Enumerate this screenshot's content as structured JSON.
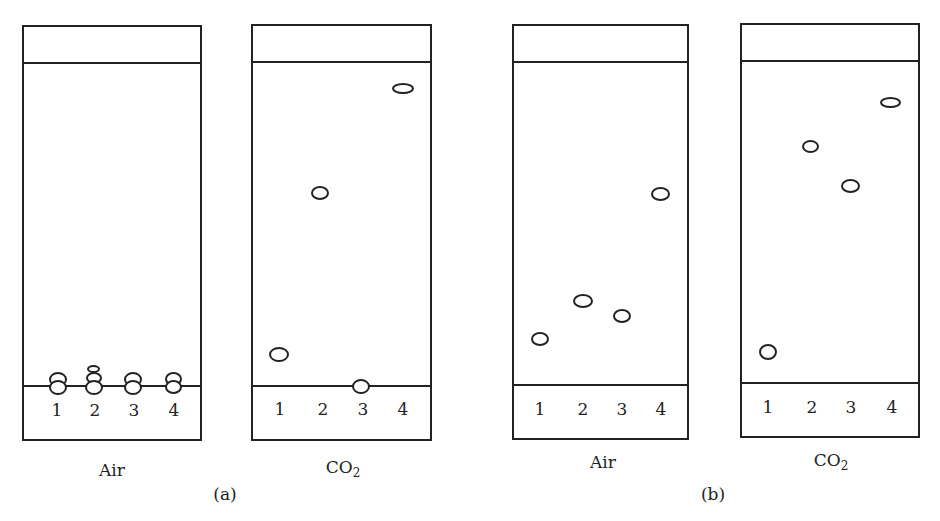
{
  "panels": [
    {
      "label": "(a)",
      "plates": [
        {
          "atmosphere": "Air",
          "lanes": [
            "1",
            "2",
            "3",
            "4"
          ]
        },
        {
          "atmosphere_main": "CO",
          "atmosphere_sub": "2",
          "lanes": [
            "1",
            "2",
            "3",
            "4"
          ]
        }
      ]
    },
    {
      "label": "(b)",
      "plates": [
        {
          "atmosphere": "Air",
          "lanes": [
            "1",
            "2",
            "3",
            "4"
          ]
        },
        {
          "atmosphere_main": "CO",
          "atmosphere_sub": "2",
          "lanes": [
            "1",
            "2",
            "3",
            "4"
          ]
        }
      ]
    }
  ]
}
